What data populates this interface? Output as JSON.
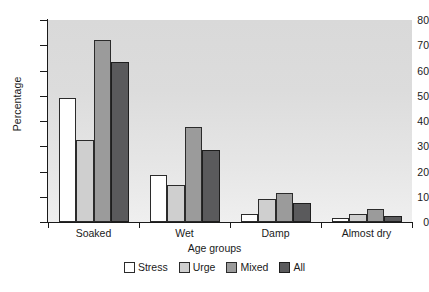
{
  "chart_data": {
    "type": "bar",
    "title": "",
    "xlabel": "Age groups",
    "ylabel": "Percentage",
    "categories": [
      "Soaked",
      "Wet",
      "Damp",
      "Almost dry"
    ],
    "series": [
      {
        "name": "Stress",
        "color": "#ffffff",
        "values": [
          49,
          18.5,
          3,
          1.5
        ]
      },
      {
        "name": "Urge",
        "color": "#cfcfcf",
        "values": [
          32.5,
          14.5,
          9,
          3
        ]
      },
      {
        "name": "Mixed",
        "color": "#9b9b9b",
        "values": [
          72,
          37.5,
          11.5,
          5
        ]
      },
      {
        "name": "All",
        "color": "#5a5a5c",
        "values": [
          63.5,
          28.5,
          7.5,
          2.5
        ]
      }
    ],
    "ylim": [
      0,
      80
    ],
    "yticks": [
      0,
      10,
      20,
      30,
      40,
      50,
      60,
      70,
      80
    ],
    "ytick_labels": [
      "0",
      "10",
      "20",
      "30",
      "40",
      "50",
      "60",
      "70",
      "80"
    ],
    "grid": false,
    "legend_position": "bottom",
    "plot_background": "#e0e0e0"
  }
}
